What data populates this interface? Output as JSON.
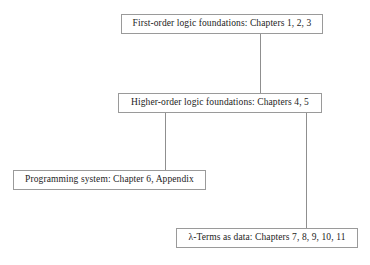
{
  "diagram": {
    "type": "hierarchy",
    "orientation": "top-down",
    "background_color": "#ffffff",
    "box_border_color": "#9a9a9a",
    "connector_color": "#8f8f8f",
    "text_color": "#1c1c1c",
    "nodes": [
      {
        "id": "first-order",
        "label": "First-order logic foundations: Chapters 1, 2, 3",
        "chapters": "1, 2, 3",
        "level": 1
      },
      {
        "id": "higher-order",
        "label": "Higher-order logic foundations: Chapters 4, 5",
        "chapters": "4, 5",
        "level": 2
      },
      {
        "id": "programming-system",
        "label": "Programming system: Chapter 6, Appendix",
        "chapters": "6, Appendix",
        "level": 3
      },
      {
        "id": "lambda-terms",
        "label": "λ-Terms as data: Chapters 7, 8, 9, 10, 11",
        "chapters": "7, 8, 9, 10, 11",
        "level": 3
      }
    ],
    "edges": [
      {
        "id": "first-to-higher",
        "from": "first-order",
        "to": "higher-order",
        "style": "vertical-line"
      },
      {
        "id": "higher-to-programming",
        "from": "higher-order",
        "to": "programming-system",
        "style": "vertical-line"
      },
      {
        "id": "higher-to-lambda",
        "from": "higher-order",
        "to": "lambda-terms",
        "style": "vertical-line"
      }
    ]
  }
}
